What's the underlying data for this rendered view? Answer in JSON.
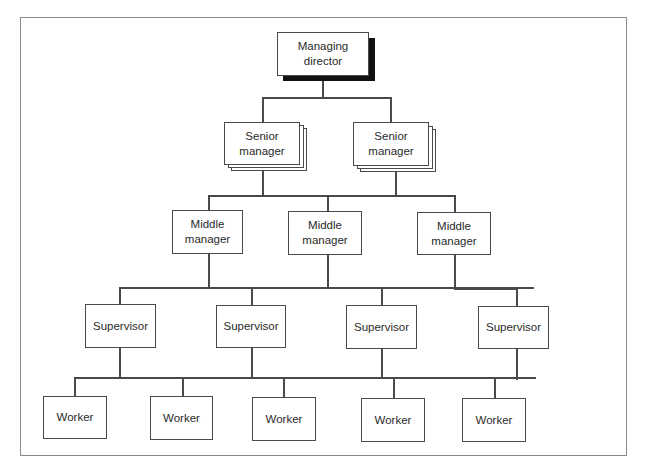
{
  "diagram": {
    "type": "organisational-hierarchy",
    "levels": [
      {
        "level": "Managing director",
        "count": 1
      },
      {
        "level": "Senior manager",
        "count": 2,
        "stacked": true
      },
      {
        "level": "Middle manager",
        "count": 3
      },
      {
        "level": "Supervisor",
        "count": 4
      },
      {
        "level": "Worker",
        "count": 5
      }
    ],
    "nodes": {
      "md": {
        "label": "Managing director",
        "line1": "Managing",
        "line2": "director"
      },
      "senior": [
        {
          "line1": "Senior",
          "line2": "manager"
        },
        {
          "line1": "Senior",
          "line2": "manager"
        }
      ],
      "middle": [
        {
          "line1": "Middle",
          "line2": "manager"
        },
        {
          "line1": "Middle",
          "line2": "manager"
        },
        {
          "line1": "Middle",
          "line2": "manager"
        }
      ],
      "supervisors": [
        {
          "label": "Supervisor"
        },
        {
          "label": "Supervisor"
        },
        {
          "label": "Supervisor"
        },
        {
          "label": "Supervisor"
        }
      ],
      "workers": [
        {
          "label": "Worker"
        },
        {
          "label": "Worker"
        },
        {
          "label": "Worker"
        },
        {
          "label": "Worker"
        },
        {
          "label": "Worker"
        }
      ]
    },
    "colors": {
      "line": "#4a4a4a",
      "shadow": "#111111",
      "frame": "#8a8a8a",
      "background": "#ffffff"
    }
  }
}
